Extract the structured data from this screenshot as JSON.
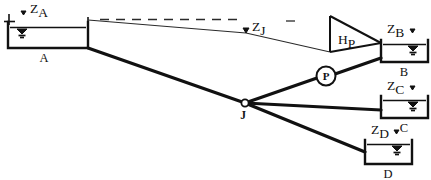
{
  "figure": {
    "type": "hydraulic-network-schematic",
    "title": "",
    "background_color": "#ffffff",
    "line_color": "#111111",
    "width": 431,
    "height": 180
  },
  "labels": {
    "z_a": {
      "base": "Z",
      "sub": "A"
    },
    "z_j": {
      "base": "Z",
      "sub": "J"
    },
    "z_b": {
      "base": "Z",
      "sub": "B"
    },
    "z_c": {
      "base": "Z",
      "sub": "C"
    },
    "z_d": {
      "base": "Z",
      "sub": "D"
    },
    "h_p": {
      "base": "H",
      "sub": "P"
    },
    "tank_a": "A",
    "tank_b": "B",
    "tank_c": "C",
    "tank_d": "D",
    "pump": "P",
    "junction": "J"
  },
  "elements": {
    "reservoirs": [
      {
        "id": "A",
        "label": "A",
        "head_label": "Z_A",
        "x": 8,
        "y": 22,
        "w": 80,
        "h": 26
      },
      {
        "id": "B",
        "label": "B",
        "head_label": "Z_B",
        "x": 380,
        "y": 40,
        "w": 48,
        "h": 22
      },
      {
        "id": "C",
        "label": "C",
        "head_label": "Z_C",
        "x": 380,
        "y": 96,
        "w": 48,
        "h": 22
      },
      {
        "id": "D",
        "label": "D",
        "head_label": "Z_D",
        "x": 364,
        "y": 140,
        "w": 48,
        "h": 24
      }
    ],
    "junction": {
      "id": "J",
      "label": "J",
      "x": 245,
      "y": 103
    },
    "pump": {
      "id": "P",
      "label": "P",
      "x": 326,
      "y": 76,
      "r": 9
    },
    "pump_head": {
      "label": "H_P",
      "apex_x": 330,
      "apex_top_y": 16,
      "apex_bottom_y": 52
    },
    "grade_lines": {
      "hgl_label_start": "Z_A",
      "hgl_label_mid": "Z_J",
      "dashed_datum": true
    }
  }
}
